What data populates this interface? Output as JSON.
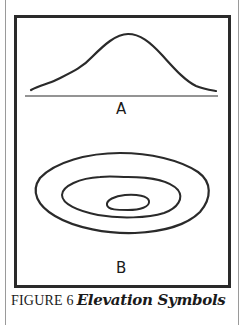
{
  "figure": {
    "number_label": "FIGURE 6",
    "title": "Elevation Symbols",
    "panels": [
      {
        "id": "A",
        "label": "A",
        "description": "profile-view hill outline above a baseline"
      },
      {
        "id": "B",
        "label": "B",
        "description": "three concentric contour lines (map view)"
      }
    ],
    "colors": {
      "ink": "#2a2a2a",
      "rule": "#9a9a9a",
      "background": "#ffffff"
    }
  }
}
